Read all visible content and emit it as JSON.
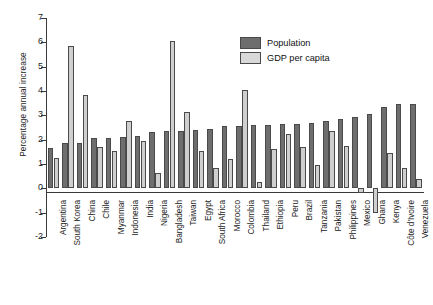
{
  "chart_data": {
    "type": "bar",
    "title": "",
    "xlabel": "",
    "ylabel": "Percentage annual increase",
    "ylim": [
      -2,
      7
    ],
    "yticks": [
      7,
      6,
      5,
      4,
      3,
      2,
      1,
      0,
      -1,
      -2
    ],
    "ytick_labels": [
      "7",
      "6",
      "5",
      "4",
      "3",
      "2",
      "1",
      "0",
      "-1",
      "-2"
    ],
    "grid": false,
    "legend_position": "top-right",
    "categories": [
      "Argentina",
      "South Korea",
      "China",
      "Chile",
      "Myanmar",
      "Indonesia",
      "India",
      "Nigeria",
      "Bangladesh",
      "Taiwan",
      "Egypt",
      "South Africa",
      "Morocco",
      "Colombia",
      "Thailand",
      "Ethiopia",
      "Peru",
      "Brazil",
      "Tanzania",
      "Pakistan",
      "Philippines",
      "Mexico",
      "Ghana",
      "Kenya",
      "Côte d'Ivoire",
      "Venezuela"
    ],
    "series": [
      {
        "name": "Population",
        "color": "#6e6e6e",
        "values": [
          1.65,
          1.85,
          1.85,
          2.05,
          2.05,
          2.1,
          2.15,
          2.3,
          2.35,
          2.35,
          2.4,
          2.45,
          2.55,
          2.55,
          2.6,
          2.6,
          2.65,
          2.65,
          2.7,
          2.75,
          2.85,
          2.95,
          3.05,
          3.35,
          3.45,
          3.45
        ]
      },
      {
        "name": "GDP per capita",
        "color": "#cfcfcf",
        "values": [
          1.25,
          5.85,
          3.85,
          1.7,
          1.55,
          2.75,
          1.95,
          0.65,
          6.05,
          3.15,
          1.55,
          0.85,
          1.2,
          4.05,
          0.25,
          1.6,
          2.25,
          1.7,
          0.95,
          2.35,
          1.75,
          -0.2,
          -1.0,
          1.45,
          0.85,
          0.4
        ]
      }
    ]
  },
  "legend": {
    "items": [
      {
        "label": "Population",
        "swatch": "pop"
      },
      {
        "label": "GDP per capita",
        "swatch": "gdp"
      }
    ]
  }
}
